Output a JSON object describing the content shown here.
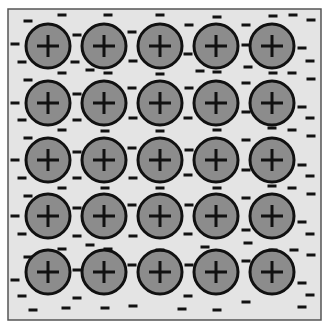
{
  "diagram": {
    "title": "Metallic bonding: positive ions in a sea of delocalised electrons",
    "box": {
      "x": 8,
      "y": 9,
      "width": 313,
      "height": 311,
      "fill": "#e4e4e4",
      "stroke": "#555555"
    },
    "ion": {
      "radius": 22,
      "fill": "#8c8c8c",
      "stroke": "#111111",
      "symbol": "+"
    },
    "ion_columns_x": [
      48,
      104,
      160,
      216,
      272
    ],
    "ion_rows_y": [
      46,
      103,
      160,
      216,
      272
    ],
    "electron": {
      "symbol": "-",
      "width": 9,
      "height": 3,
      "color": "#111111"
    },
    "electrons": [
      [
        28,
        21
      ],
      [
        62,
        15
      ],
      [
        108,
        15
      ],
      [
        160,
        15
      ],
      [
        217,
        17
      ],
      [
        273,
        16
      ],
      [
        293,
        15
      ],
      [
        311,
        20
      ],
      [
        15,
        44
      ],
      [
        77,
        35
      ],
      [
        132,
        32
      ],
      [
        189,
        25
      ],
      [
        246,
        25
      ],
      [
        22,
        62
      ],
      [
        75,
        62
      ],
      [
        133,
        61
      ],
      [
        188,
        54
      ],
      [
        246,
        45
      ],
      [
        302,
        48
      ],
      [
        310,
        61
      ],
      [
        62,
        73
      ],
      [
        90,
        70
      ],
      [
        108,
        73
      ],
      [
        160,
        74
      ],
      [
        217,
        72
      ],
      [
        248,
        67
      ],
      [
        273,
        73
      ],
      [
        292,
        73
      ],
      [
        311,
        79
      ],
      [
        28,
        80
      ],
      [
        200,
        71
      ],
      [
        15,
        103
      ],
      [
        77,
        94
      ],
      [
        132,
        88
      ],
      [
        189,
        88
      ],
      [
        246,
        83
      ],
      [
        302,
        107
      ],
      [
        22,
        120
      ],
      [
        77,
        120
      ],
      [
        133,
        118
      ],
      [
        188,
        118
      ],
      [
        246,
        112
      ],
      [
        310,
        118
      ],
      [
        62,
        130
      ],
      [
        105,
        131
      ],
      [
        160,
        131
      ],
      [
        217,
        130
      ],
      [
        272,
        128
      ],
      [
        292,
        130
      ],
      [
        311,
        136
      ],
      [
        28,
        138
      ],
      [
        15,
        160
      ],
      [
        77,
        152
      ],
      [
        132,
        148
      ],
      [
        189,
        150
      ],
      [
        246,
        140
      ],
      [
        302,
        165
      ],
      [
        22,
        178
      ],
      [
        77,
        178
      ],
      [
        133,
        178
      ],
      [
        188,
        175
      ],
      [
        246,
        170
      ],
      [
        310,
        176
      ],
      [
        62,
        188
      ],
      [
        105,
        188
      ],
      [
        160,
        188
      ],
      [
        217,
        188
      ],
      [
        272,
        186
      ],
      [
        292,
        188
      ],
      [
        311,
        194
      ],
      [
        28,
        196
      ],
      [
        15,
        216
      ],
      [
        77,
        208
      ],
      [
        132,
        205
      ],
      [
        189,
        205
      ],
      [
        246,
        198
      ],
      [
        302,
        222
      ],
      [
        22,
        234
      ],
      [
        77,
        236
      ],
      [
        133,
        236
      ],
      [
        188,
        234
      ],
      [
        246,
        230
      ],
      [
        310,
        234
      ],
      [
        62,
        249
      ],
      [
        90,
        245
      ],
      [
        108,
        249
      ],
      [
        160,
        250
      ],
      [
        205,
        247
      ],
      [
        248,
        243
      ],
      [
        273,
        250
      ],
      [
        294,
        250
      ],
      [
        311,
        255
      ],
      [
        28,
        257
      ],
      [
        15,
        280
      ],
      [
        77,
        270
      ],
      [
        132,
        265
      ],
      [
        189,
        265
      ],
      [
        246,
        261
      ],
      [
        302,
        283
      ],
      [
        22,
        296
      ],
      [
        77,
        298
      ],
      [
        133,
        306
      ],
      [
        188,
        296
      ],
      [
        246,
        302
      ],
      [
        310,
        295
      ],
      [
        33,
        310
      ],
      [
        66,
        308
      ],
      [
        105,
        308
      ],
      [
        182,
        309
      ],
      [
        217,
        310
      ],
      [
        302,
        307
      ]
    ]
  }
}
